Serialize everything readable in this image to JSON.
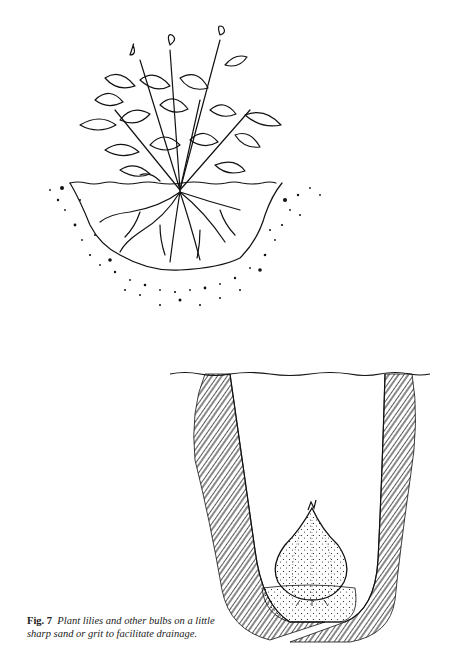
{
  "figure": {
    "label": "Fig. 7",
    "caption": "Plant lilies and other bulbs on a little sharp sand or grit to facilitate drainage.",
    "illustrations": [
      {
        "name": "plant-in-hole",
        "description": "Leafy plant with spread roots set in a shallow planting hole in gravelly soil"
      },
      {
        "name": "bulb-in-trench",
        "description": "Lily bulb sitting on a layer of sharp sand at the bottom of a deep narrow trench"
      }
    ]
  }
}
